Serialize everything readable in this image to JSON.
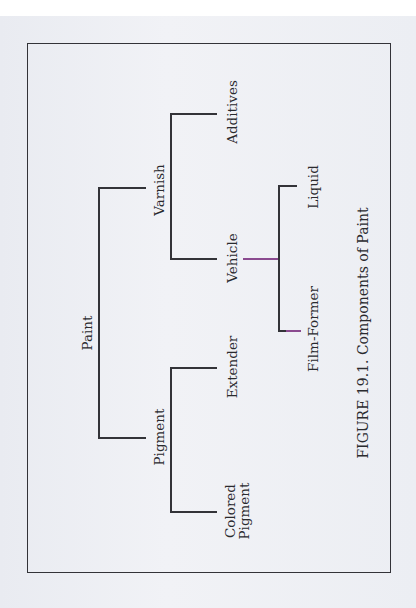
{
  "figure": {
    "caption": "FIGURE 19.1. Components of Paint"
  },
  "tree": {
    "root": "Paint",
    "level1": [
      "Varnish",
      "Pigment"
    ],
    "varnish_children": [
      "Additives",
      "Vehicle"
    ],
    "pigment_children": [
      "Extender",
      "Colored\nPigment"
    ],
    "vehicle_children": [
      "Liquid",
      "Film-Former"
    ]
  },
  "colors": {
    "line": "#333338",
    "accent_line": "#8a4a8f",
    "background": "#eef0f5"
  }
}
